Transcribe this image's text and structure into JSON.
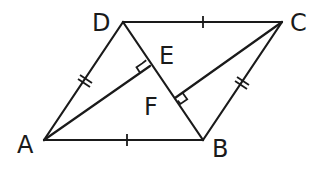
{
  "figure": {
    "type": "geometry",
    "stroke_color": "#1a1a1a",
    "background": "#ffffff"
  },
  "points": {
    "A": {
      "label": "A",
      "x": 44,
      "y": 140,
      "label_x": 17,
      "label_y": 153
    },
    "B": {
      "label": "B",
      "x": 203,
      "y": 140,
      "label_x": 212,
      "label_y": 157
    },
    "C": {
      "label": "C",
      "x": 282,
      "y": 22,
      "label_x": 290,
      "label_y": 31
    },
    "D": {
      "label": "D",
      "x": 123,
      "y": 22,
      "label_x": 92,
      "label_y": 31
    },
    "E": {
      "label": "E",
      "x": 150,
      "y": 66,
      "label_x": 159,
      "label_y": 64
    },
    "F": {
      "label": "F",
      "x": 175,
      "y": 98,
      "label_x": 144,
      "label_y": 115
    }
  },
  "segments": [
    {
      "from": "A",
      "to": "B",
      "tick": "single"
    },
    {
      "from": "B",
      "to": "C",
      "tick": "double"
    },
    {
      "from": "C",
      "to": "D",
      "tick": "single"
    },
    {
      "from": "D",
      "to": "A",
      "tick": "double"
    },
    {
      "from": "D",
      "to": "B",
      "tick": "none"
    },
    {
      "from": "A",
      "to": "E",
      "tick": "none"
    },
    {
      "from": "C",
      "to": "F",
      "tick": "none"
    }
  ],
  "right_angles": [
    {
      "at": "E",
      "between": [
        "A",
        "D"
      ]
    },
    {
      "at": "F",
      "between": [
        "C",
        "B"
      ]
    }
  ],
  "equalities": [
    "AB = DC",
    "AD = BC"
  ]
}
